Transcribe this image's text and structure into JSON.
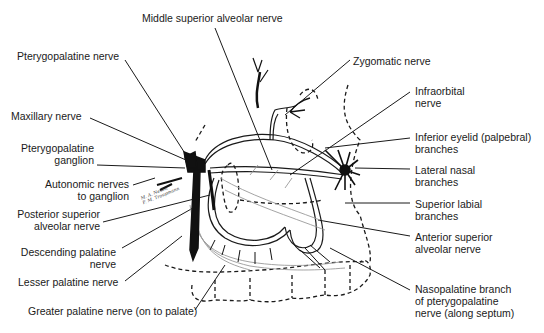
{
  "diagram": {
    "labels_left": [
      {
        "id": "pterygopalatine-nerve",
        "text": "Pterygopalatine nerve"
      },
      {
        "id": "maxillary-nerve",
        "text": "Maxillary nerve"
      },
      {
        "id": "pterygopalatine-ganglion",
        "line1": "Pterygopalatine",
        "line2": "ganglion"
      },
      {
        "id": "autonomic-nerves",
        "line1": "Autonomic nerves",
        "line2": "to ganglion"
      },
      {
        "id": "posterior-superior-alveolar",
        "line1": "Posterior superior",
        "line2": "alveolar nerve"
      },
      {
        "id": "descending-palatine",
        "line1": "Descending palatine",
        "line2": "nerve"
      },
      {
        "id": "lesser-palatine",
        "text": "Lesser palatine nerve"
      }
    ],
    "labels_top": [
      {
        "id": "middle-superior-alveolar",
        "text": "Middle superior alveolar nerve"
      },
      {
        "id": "zygomatic-nerve",
        "text": "Zygomatic nerve"
      }
    ],
    "labels_right": [
      {
        "id": "infraorbital-nerve",
        "line1": "Infraorbital",
        "line2": "nerve"
      },
      {
        "id": "inferior-eyelid",
        "line1": "Inferior eyelid (palpebral)",
        "line2": "branches"
      },
      {
        "id": "lateral-nasal",
        "line1": "Lateral nasal",
        "line2": "branches"
      },
      {
        "id": "superior-labial",
        "line1": "Superior labial",
        "line2": "branches"
      },
      {
        "id": "anterior-superior-alveolar",
        "line1": "Anterior superior",
        "line2": "alveolar nerve"
      },
      {
        "id": "nasopalatine",
        "line1": "Nasopalatine branch",
        "line2": "of pterygopalatine",
        "line3": "nerve (along septum)"
      }
    ],
    "labels_bottom": [
      {
        "id": "greater-palatine",
        "text": "Greater palatine nerve (on to palate)"
      }
    ],
    "signature": {
      "line1": "M. A. Nesbit",
      "line2": "F. M. Troupmann"
    }
  }
}
